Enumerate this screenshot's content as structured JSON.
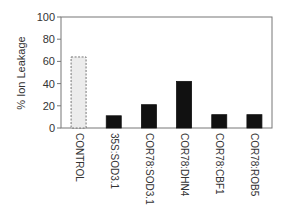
{
  "chart_data": {
    "type": "bar",
    "title": "",
    "xlabel": "",
    "ylabel": "% Ion Leakage",
    "ylim": [
      0,
      100
    ],
    "yticks": [
      0,
      20,
      40,
      60,
      80,
      100
    ],
    "grid": false,
    "legend": null,
    "categories": [
      "CONTROL",
      "35S:SOD3.1",
      "COR78:SOD3.1",
      "COR78:DHN4",
      "COR78:CBF1",
      "COR78:ROB5"
    ],
    "values": [
      64,
      11,
      21,
      42,
      12,
      12
    ],
    "bar_styles": [
      "dashed-light",
      "solid-dark",
      "solid-dark",
      "solid-dark",
      "solid-dark",
      "solid-dark"
    ],
    "colors": {
      "control_fill": "#ececec",
      "control_stroke": "#555555",
      "bar_fill": "#111111",
      "axis": "#777777"
    }
  }
}
